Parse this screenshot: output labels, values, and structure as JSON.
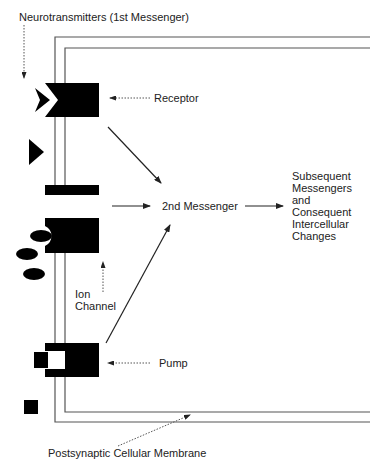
{
  "diagram": {
    "title_label": "Neurotransmitters (1st Messenger)",
    "labels": {
      "receptor": "Receptor",
      "second_messenger": "2nd Messenger",
      "subsequent": "Subsequent\nMessengers\nand\nConsequent\nIntercellular\nChanges",
      "ion_channel": "Ion\nChannel",
      "pump": "Pump",
      "membrane": "Postsynaptic Cellular Membrane"
    },
    "colors": {
      "ink": "#000000",
      "line": "#555555",
      "text": "#222222",
      "background": "#ffffff"
    }
  }
}
